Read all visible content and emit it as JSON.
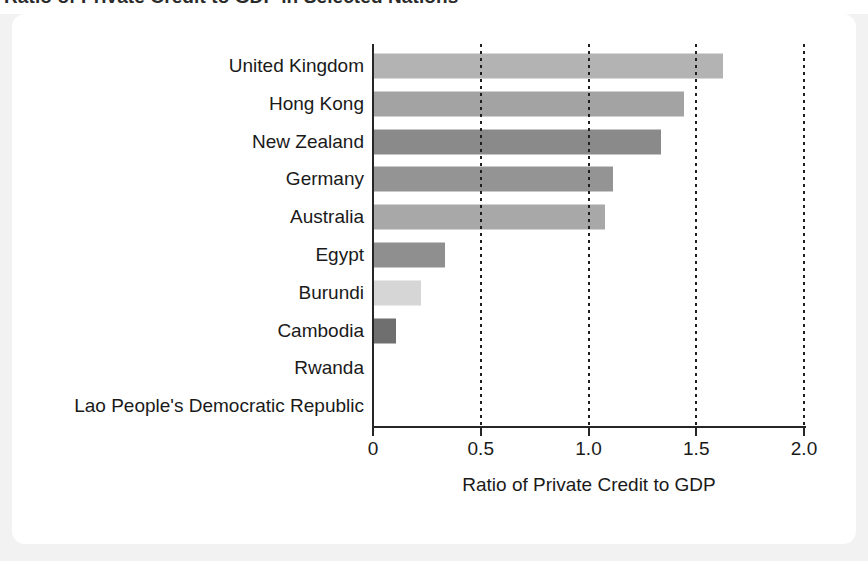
{
  "title": "Ratio of Private Credit to GDP in Selected Nations",
  "xaxis_label": "Ratio of Private Credit to GDP",
  "ticks": [
    "0",
    "0.5",
    "1.0",
    "1.5",
    "2.0"
  ],
  "colors": {
    "card": "#ffffff",
    "page": "#f2f2f2",
    "axis": "#262626",
    "text": "#1a1a1a"
  },
  "chart_data": {
    "type": "bar",
    "orientation": "horizontal",
    "title": "Ratio of Private Credit to GDP in Selected Nations",
    "xlabel": "Ratio of Private Credit to GDP",
    "ylabel": "",
    "xlim": [
      0,
      2.0
    ],
    "xticks": [
      0,
      0.5,
      1.0,
      1.5,
      2.0
    ],
    "xticklabels": [
      "0",
      "0.5",
      "1.0",
      "1.5",
      "2.0"
    ],
    "grid": "vertical-dotted",
    "legend": "none",
    "categories": [
      "United Kingdom",
      "Hong Kong",
      "New Zealand",
      "Germany",
      "Australia",
      "Egypt",
      "Burundi",
      "Cambodia",
      "Rwanda",
      "Lao People's Democratic Republic"
    ],
    "values": [
      1.62,
      1.44,
      1.33,
      1.11,
      1.07,
      0.33,
      0.22,
      0.1,
      0.0,
      0.0
    ],
    "bar_colors": [
      "#b3b3b3",
      "#a3a3a3",
      "#8a8a8a",
      "#949494",
      "#a8a8a8",
      "#8f8f8f",
      "#d6d6d6",
      "#6f6f6f",
      "#9a9a9a",
      "#9a9a9a"
    ]
  }
}
